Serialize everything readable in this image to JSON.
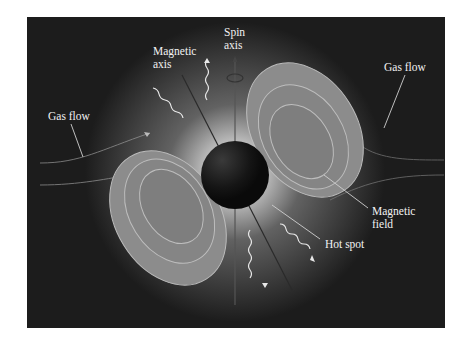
{
  "diagram": {
    "labels": {
      "magnetic_axis_1": "Magnetic",
      "magnetic_axis_2": "axis",
      "spin_axis_1": "Spin",
      "spin_axis_2": "axis",
      "gas_flow_left": "Gas flow",
      "gas_flow_right": "Gas flow",
      "magnetic_field_1": "Magnetic",
      "magnetic_field_2": "field",
      "hot_spot": "Hot spot"
    },
    "colors": {
      "background": "#1c1c1c",
      "label_text": "#f2f2f2",
      "field_lobe": "#8a8a8a",
      "star": "#141414"
    }
  }
}
